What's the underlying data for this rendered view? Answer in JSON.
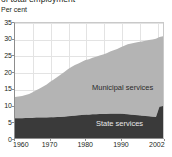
{
  "chart_title": "of total employment",
  "unit_label": "Per cent",
  "y_ticks": [
    "35",
    "30",
    "25",
    "20",
    "15",
    "10",
    "5",
    "0"
  ],
  "x_ticks": [
    "1960",
    "1970",
    "1980",
    "1990",
    "2002"
  ],
  "series_labels": {
    "municipal": "Municipal services",
    "state": "State services"
  },
  "colors": {
    "municipal": "#b4b4b4",
    "state": "#3a3a3a",
    "axis": "#8d8d8d",
    "grid": "#e3e3e3",
    "plot_background": "#ffffff",
    "text": "#231f20"
  },
  "chart_data": {
    "type": "area",
    "title": "of total employment",
    "xlabel": "",
    "ylabel": "Per cent",
    "xlim": [
      1960,
      2002
    ],
    "ylim": [
      0,
      35
    ],
    "ytick_values": [
      0,
      5,
      10,
      15,
      20,
      25,
      30,
      35
    ],
    "xtick_values": [
      1960,
      1970,
      1980,
      1990,
      2002
    ],
    "grid": true,
    "legend": "inline-labels",
    "stacked": true,
    "x": [
      1960,
      1961,
      1962,
      1963,
      1964,
      1965,
      1966,
      1967,
      1968,
      1969,
      1970,
      1971,
      1972,
      1973,
      1974,
      1975,
      1976,
      1977,
      1978,
      1979,
      1980,
      1981,
      1982,
      1983,
      1984,
      1985,
      1986,
      1987,
      1988,
      1989,
      1990,
      1991,
      1992,
      1993,
      1994,
      1995,
      1996,
      1997,
      1998,
      1999,
      2000,
      2001,
      2002
    ],
    "series": [
      {
        "name": "State services",
        "values": [
          6.0,
          6.0,
          6.0,
          6.1,
          6.1,
          6.1,
          6.2,
          6.2,
          6.2,
          6.2,
          6.3,
          6.3,
          6.4,
          6.4,
          6.5,
          6.6,
          6.7,
          6.8,
          6.9,
          7.0,
          7.1,
          7.1,
          7.2,
          7.2,
          7.3,
          7.3,
          7.3,
          7.4,
          7.4,
          7.4,
          7.4,
          7.3,
          7.2,
          7.1,
          7.0,
          6.9,
          6.8,
          6.7,
          6.6,
          6.5,
          6.4,
          9.5,
          9.7
        ]
      },
      {
        "name": "Municipal services",
        "values": [
          6.5,
          6.6,
          6.8,
          7.0,
          7.3,
          7.8,
          8.3,
          8.9,
          9.5,
          10.1,
          10.8,
          11.5,
          12.2,
          12.9,
          13.6,
          14.3,
          14.9,
          15.4,
          15.8,
          16.2,
          16.6,
          16.9,
          17.2,
          17.5,
          17.8,
          18.1,
          18.5,
          18.9,
          19.3,
          19.7,
          20.2,
          20.8,
          21.3,
          21.7,
          22.0,
          22.3,
          22.6,
          22.9,
          23.2,
          23.5,
          23.8,
          21.2,
          21.3
        ]
      }
    ],
    "totals": [
      12.5,
      12.6,
      12.8,
      13.1,
      13.4,
      13.9,
      14.5,
      15.1,
      15.7,
      16.3,
      17.1,
      17.8,
      18.6,
      19.3,
      20.1,
      20.9,
      21.6,
      22.2,
      22.7,
      23.2,
      23.7,
      24.0,
      24.4,
      24.7,
      25.1,
      25.4,
      25.8,
      26.3,
      26.7,
      27.1,
      27.6,
      28.1,
      28.5,
      28.8,
      29.0,
      29.2,
      29.4,
      29.6,
      29.8,
      30.0,
      30.2,
      30.7,
      31.0
    ]
  }
}
